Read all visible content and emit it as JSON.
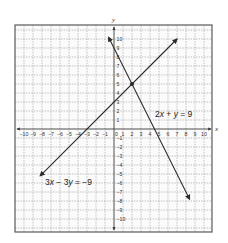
{
  "chart_data": {
    "type": "line",
    "title": "",
    "xlabel": "x",
    "ylabel": "y",
    "xlim": [
      -11,
      11
    ],
    "ylim": [
      -11,
      11
    ],
    "grid": true,
    "x_ticks": [
      -10,
      -9,
      -8,
      -7,
      -6,
      -5,
      -4,
      -3,
      -2,
      -1,
      0,
      1,
      2,
      3,
      4,
      5,
      6,
      7,
      8,
      9,
      10
    ],
    "y_ticks": [
      -10,
      -9,
      -8,
      -7,
      -6,
      -5,
      -4,
      -3,
      -2,
      -1,
      1,
      2,
      3,
      4,
      5,
      6,
      7,
      8,
      9,
      10
    ],
    "series": [
      {
        "name": "2x + y = 9",
        "slope": -2,
        "intercept": 9,
        "x": [
          -0.6,
          8.4
        ],
        "y": [
          10.2,
          -7.8
        ]
      },
      {
        "name": "3x − 3y = −9",
        "slope": 1,
        "intercept": 3,
        "x": [
          -8.2,
          7
        ],
        "y": [
          -5.2,
          10
        ]
      }
    ],
    "points": [
      {
        "label": "intersection",
        "x": 2,
        "y": 5
      }
    ],
    "annotations": [
      {
        "text": "2x + y = 9",
        "x": 5.8,
        "y": 1.7
      },
      {
        "text": "3x − 3y = −9",
        "x": -7.6,
        "y": -5.7
      }
    ]
  },
  "labels": {
    "x_axis": "x",
    "y_axis": "y",
    "eq1_parts": [
      "2",
      "x",
      " + ",
      "y",
      " = 9"
    ],
    "eq2_parts": [
      "3",
      "x",
      " − 3",
      "y",
      " = −9"
    ]
  },
  "colors": {
    "frame": "#5a5a5a",
    "grid": "#9a9a9a",
    "axis": "#3a3a3a",
    "line": "#2a2a2a",
    "text": "#333333"
  }
}
